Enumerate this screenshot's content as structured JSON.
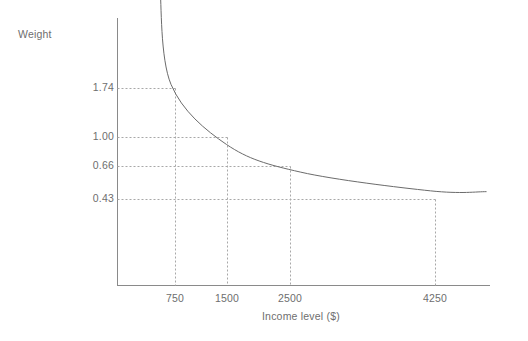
{
  "chart_data": {
    "type": "line",
    "title": "",
    "xlabel": "Income level ($)",
    "ylabel": "Weight",
    "x": [
      750,
      1500,
      2500,
      4250
    ],
    "values": [
      1.74,
      1.0,
      0.66,
      0.43
    ],
    "x_tick_labels": [
      "750",
      "1500",
      "2500",
      "4250"
    ],
    "y_tick_labels": [
      "1.74",
      "1.00",
      "0.66",
      "0.43"
    ],
    "xlim": [
      0,
      5500
    ],
    "ylim": [
      0,
      3.2
    ],
    "grid": false,
    "guide_lines": "dotted",
    "legend": "none",
    "series": [
      {
        "name": "Weight",
        "description": "Decreasing convex curve of weight versus income level",
        "points": [
          {
            "x": 600,
            "y": 2.95
          },
          {
            "x": 750,
            "y": 1.74
          },
          {
            "x": 1500,
            "y": 1.0
          },
          {
            "x": 2500,
            "y": 0.66
          },
          {
            "x": 4250,
            "y": 0.43
          },
          {
            "x": 5000,
            "y": 0.42
          }
        ]
      }
    ]
  },
  "axes": {
    "y_label": "Weight",
    "x_label": "Income level ($)",
    "y_ticks": [
      "1.74",
      "1.00",
      "0.66",
      "0.43"
    ],
    "x_ticks": [
      "750",
      "1500",
      "2500",
      "4250"
    ]
  },
  "colors": {
    "axis": "#8a8a8a",
    "curve": "#6b6b6b",
    "guide": "#a8a8a8",
    "text": "#6e6e6e",
    "background": "#ffffff"
  }
}
